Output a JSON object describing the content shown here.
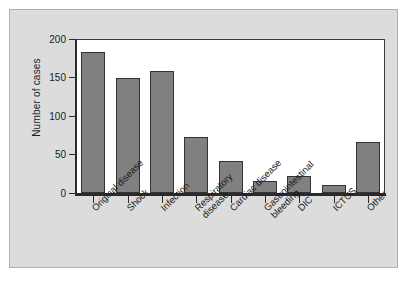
{
  "chart_data": {
    "type": "bar",
    "title": "",
    "xlabel": "",
    "ylabel": "Number of cases",
    "ylim": [
      0,
      200
    ],
    "yticks": [
      0,
      50,
      100,
      150,
      200
    ],
    "grid": false,
    "legend": null,
    "bar_color": "#808080",
    "bar_edge_color": "#333333",
    "plot_background": "#ffffff",
    "figure_background": "#dcdcdc",
    "categories": [
      "Original disease",
      "Shock",
      "Infection",
      "Respiratory\ndisease",
      "Cardiac disease",
      "Gastrointestinal\nbleeding",
      "DIC",
      "ICTUS",
      "Other"
    ],
    "values": [
      183,
      150,
      158,
      73,
      42,
      16,
      22,
      10,
      66
    ]
  }
}
